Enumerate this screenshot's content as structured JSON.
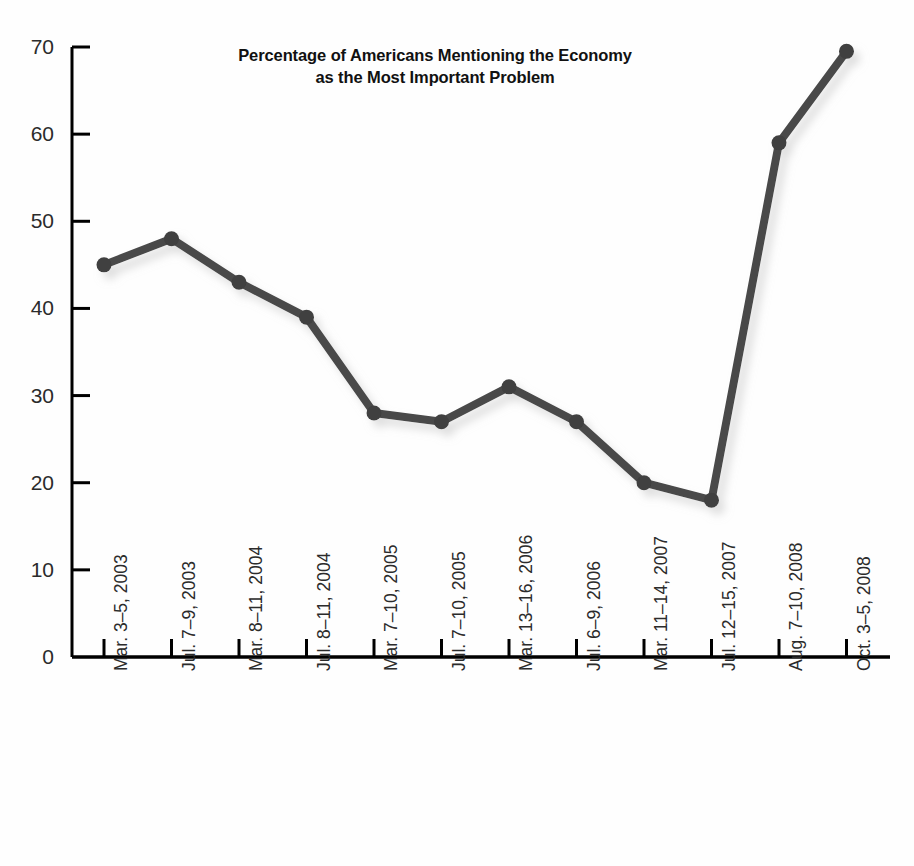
{
  "chart_data": {
    "type": "line",
    "title": "Percentage of Americans Mentioning the Economy as the Most Important Problem",
    "title_line1": "Percentage of Americans Mentioning the Economy",
    "title_line2": "as the Most Important Problem",
    "xlabel": "",
    "ylabel": "",
    "ylim": [
      0,
      70
    ],
    "ytick_step": 10,
    "yticks": [
      "0",
      "10",
      "20",
      "30",
      "40",
      "50",
      "60",
      "70"
    ],
    "ytick_values": [
      0,
      10,
      20,
      30,
      40,
      50,
      60,
      70
    ],
    "grid": false,
    "legend": false,
    "legend_position": "none",
    "line_color": "#4a4a4a",
    "marker_color": "#3f3f3f",
    "axis_color": "#000000",
    "background_color": "#ffffff",
    "categories": [
      "Mar. 3–5, 2003",
      "Jul. 7–9, 2003",
      "Mar. 8–11, 2004",
      "Jul. 8–11, 2004",
      "Mar. 7–10, 2005",
      "Jul. 7–10, 2005",
      "Mar. 13–16, 2006",
      "Jul. 6–9, 2006",
      "Mar. 11–14, 2007",
      "Jul. 12–15, 2007",
      "Aug. 7–10, 2008",
      "Oct. 3–5, 2008"
    ],
    "values": [
      45,
      48,
      43,
      39,
      28,
      27,
      31,
      27,
      20,
      18,
      59,
      69.5
    ]
  },
  "geometry": {
    "plot_left": 104,
    "plot_right": 847,
    "baseline_y": 657,
    "top_y": 47,
    "x_step": 67.5
  }
}
